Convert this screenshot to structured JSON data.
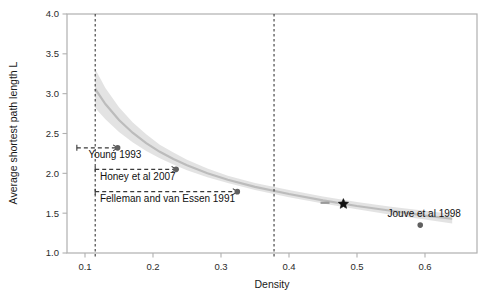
{
  "chart_data": {
    "type": "scatter",
    "title": "",
    "xlabel": "Density",
    "ylabel": "Average shortest path length L",
    "xlim": [
      0.07,
      0.645
    ],
    "ylim": [
      1.0,
      4.0
    ],
    "grid": false,
    "legend": "none",
    "xticks": [
      0.1,
      0.2,
      0.3,
      0.4,
      0.5,
      0.6
    ],
    "xticklabels": [
      "0.1",
      "0.2",
      "0.3",
      "0.4",
      "0.5",
      "0.6"
    ],
    "yticks": [
      1.0,
      1.5,
      2.0,
      2.5,
      3.0,
      3.5,
      4.0
    ],
    "yticklabels": [
      "1.0",
      "1.5",
      "2.0",
      "2.5",
      "3.0",
      "3.5",
      "4.0"
    ],
    "points": [
      {
        "name": "Young 1993",
        "x": 0.148,
        "y": 2.32,
        "marker": "circle"
      },
      {
        "name": "Honey et al 2007",
        "x": 0.234,
        "y": 2.05,
        "marker": "circle"
      },
      {
        "name": "Felleman and van Essen 1991",
        "x": 0.324,
        "y": 1.77,
        "marker": "circle"
      },
      {
        "name": "unlabeled",
        "x": 0.453,
        "y": 1.63,
        "marker": "dash"
      },
      {
        "name": "highlight",
        "x": 0.48,
        "y": 1.615,
        "marker": "star"
      },
      {
        "name": "Jouve et al 1998",
        "x": 0.593,
        "y": 1.35,
        "marker": "circle"
      }
    ],
    "annotations": [
      {
        "label": "Young 1993",
        "x": 0.105,
        "y": 2.19
      },
      {
        "label": "Honey et al 2007",
        "x": 0.122,
        "y": 1.92
      },
      {
        "label": "Felleman and van Essen 1991",
        "x": 0.122,
        "y": 1.645
      }
    ],
    "vlines": [
      {
        "x": 0.115,
        "style": "dashed"
      },
      {
        "x": 0.378,
        "style": "dashed"
      }
    ],
    "hlines": [
      {
        "y": 2.32,
        "x0": 0.088,
        "x1": 0.148,
        "style": "dashed"
      },
      {
        "y": 2.05,
        "x0": 0.115,
        "x1": 0.234,
        "style": "dashed"
      },
      {
        "y": 1.77,
        "x0": 0.115,
        "x1": 0.324,
        "style": "dashed"
      }
    ],
    "fit_curve": {
      "description": "decreasing power-law fit with shaded confidence band",
      "x": [
        0.115,
        0.13,
        0.15,
        0.17,
        0.19,
        0.21,
        0.23,
        0.25,
        0.28,
        0.31,
        0.35,
        0.4,
        0.45,
        0.5,
        0.55,
        0.6,
        0.64
      ],
      "y_fit": [
        3.06,
        2.87,
        2.67,
        2.51,
        2.38,
        2.27,
        2.18,
        2.1,
        2.0,
        1.92,
        1.83,
        1.74,
        1.66,
        1.59,
        1.53,
        1.47,
        1.43
      ],
      "y_lower": [
        2.82,
        2.68,
        2.52,
        2.39,
        2.28,
        2.19,
        2.11,
        2.04,
        1.95,
        1.88,
        1.79,
        1.7,
        1.62,
        1.55,
        1.48,
        1.42,
        1.37
      ],
      "y_upper": [
        3.31,
        3.07,
        2.83,
        2.64,
        2.49,
        2.36,
        2.26,
        2.17,
        2.06,
        1.97,
        1.88,
        1.79,
        1.71,
        1.64,
        1.58,
        1.53,
        1.49
      ]
    },
    "colors": {
      "band": "#d9d9d9",
      "fit_line": "#bcbcbc",
      "point": "#606060",
      "star": "#111111",
      "dashed_line": "#3a3a3a",
      "frame": "#b0b0b0",
      "text": "#111111"
    }
  }
}
